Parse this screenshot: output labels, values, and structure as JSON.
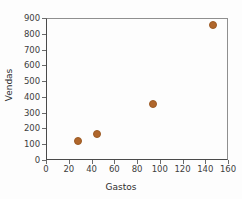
{
  "chart_data": {
    "type": "scatter",
    "title": "",
    "xlabel": "Gastos",
    "ylabel": "Vendas",
    "xlim": [
      0,
      160
    ],
    "ylim": [
      0,
      900
    ],
    "xticks": [
      0,
      20,
      40,
      60,
      80,
      100,
      120,
      140,
      160
    ],
    "yticks": [
      0,
      100,
      200,
      300,
      400,
      500,
      600,
      700,
      800,
      900
    ],
    "grid": false,
    "legend": false,
    "marker_color": "#b0662b",
    "series": [
      {
        "name": "Vendas vs Gastos",
        "points": [
          {
            "x": 28,
            "y": 122
          },
          {
            "x": 45,
            "y": 165
          },
          {
            "x": 94,
            "y": 352
          },
          {
            "x": 147,
            "y": 855
          }
        ]
      }
    ]
  },
  "axes": {
    "x_tick_labels": [
      "0",
      "20",
      "40",
      "60",
      "80",
      "100",
      "120",
      "140",
      "160"
    ],
    "y_tick_labels": [
      "0",
      "100",
      "200",
      "300",
      "400",
      "500",
      "600",
      "700",
      "800",
      "900"
    ],
    "x_axis_title": "Gastos",
    "y_axis_title": "Vendas"
  },
  "colors": {
    "marker": "#b0662b",
    "axis": "#4a4a4a",
    "text": "#3d3d3d",
    "background": "#fdfdfd"
  }
}
